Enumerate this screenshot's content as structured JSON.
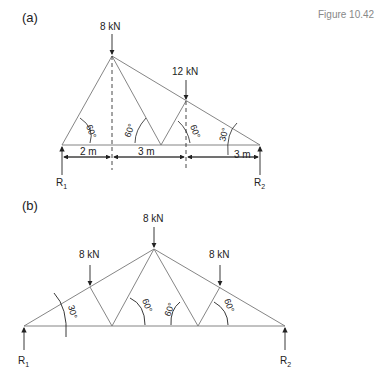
{
  "figure_label": "Figure 10.42",
  "part_a": {
    "label": "(a)",
    "loads": [
      "8 kN",
      "12 kN"
    ],
    "angles": [
      "60°",
      "60°",
      "60°",
      "30°"
    ],
    "dims": [
      "2 m",
      "3 m",
      "3 m"
    ],
    "reactions": [
      "R",
      "1",
      "R",
      "2"
    ]
  },
  "part_b": {
    "label": "(b)",
    "loads": [
      "8 kN",
      "8 kN",
      "8 kN"
    ],
    "angles": [
      "30°",
      "60°",
      "60°",
      "60°"
    ],
    "reactions": [
      "R",
      "1",
      "R",
      "2"
    ]
  }
}
